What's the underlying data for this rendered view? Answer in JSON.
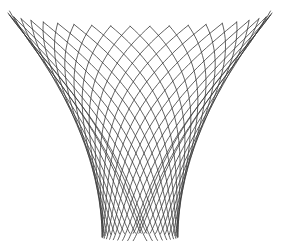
{
  "figure": {
    "width": 284,
    "height": 249,
    "background": "#ffffff",
    "stroke_color": "#3a3a3a",
    "stroke_width": 0.8,
    "center_x": 140,
    "top_y": 13,
    "bottom_y": 237,
    "top_radius": 132,
    "bottom_radius": 38,
    "ellipse_ratio": 0.1,
    "line_count_per_family": 22,
    "twist": 1.9,
    "families": [
      "clockwise",
      "counterclockwise"
    ]
  }
}
